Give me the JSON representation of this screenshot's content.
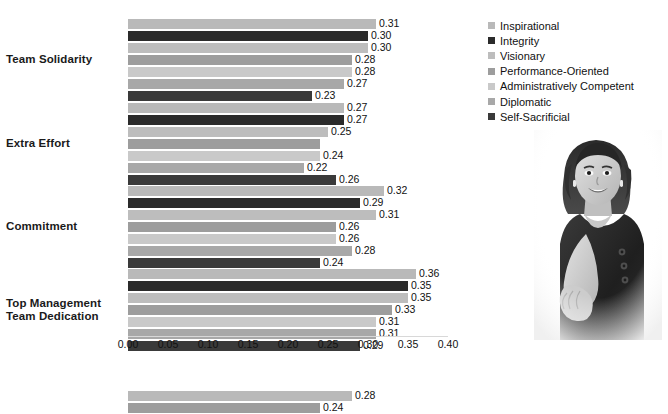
{
  "chart_data": {
    "type": "bar",
    "orientation": "horizontal",
    "title": "",
    "xlabel": "",
    "ylabel": "",
    "xlim": [
      0.0,
      0.4
    ],
    "xticks": [
      "0.00",
      "0.05",
      "0.10",
      "0.15",
      "0.20",
      "0.25",
      "0.30",
      "0.35",
      "0.40"
    ],
    "xtick_values": [
      0.0,
      0.05,
      0.1,
      0.15,
      0.2,
      0.25,
      0.3,
      0.35,
      0.4
    ],
    "grid": false,
    "legend_position": "top-right",
    "categories": [
      "Team Solidarity",
      "Extra Effort",
      "Commitment",
      "Top Management Team Dedication"
    ],
    "series": [
      {
        "name": "Inspirational",
        "color": "#b9b9b9",
        "values": [
          0.31,
          0.27,
          0.32,
          0.36
        ],
        "labels": [
          "0.31",
          "0.27",
          "0.32",
          "0.36"
        ]
      },
      {
        "name": "Integrity",
        "color": "#2b2b2b",
        "values": [
          0.3,
          0.27,
          0.29,
          0.35
        ],
        "labels": [
          "0.30",
          "0.27",
          "0.29",
          "0.35"
        ]
      },
      {
        "name": "Visionary",
        "color": "#bdbdbd",
        "values": [
          0.3,
          0.25,
          0.31,
          0.35
        ],
        "labels": [
          "0.30",
          "0.25",
          "0.31",
          "0.35"
        ]
      },
      {
        "name": "Performance-Oriented",
        "color": "#9d9d9d",
        "values": [
          0.28,
          0.24,
          0.26,
          0.33
        ],
        "labels": [
          "0.28",
          "",
          "0.26",
          "0.33"
        ]
      },
      {
        "name": "Administratively Competent",
        "color": "#c9c9c9",
        "values": [
          0.28,
          0.24,
          0.26,
          0.31
        ],
        "labels": [
          "0.28",
          "0.24",
          "0.26",
          "0.31"
        ]
      },
      {
        "name": "Diplomatic",
        "color": "#a8a8a8",
        "values": [
          0.27,
          0.22,
          0.28,
          0.31
        ],
        "labels": [
          "0.27",
          "0.22",
          "0.28",
          "0.31"
        ]
      },
      {
        "name": "Self-Sacrificial",
        "color": "#3a3a3a",
        "values": [
          0.23,
          0.26,
          0.24,
          0.29
        ],
        "labels": [
          "0.23",
          "0.26",
          "0.24",
          "0.29"
        ]
      }
    ]
  },
  "legend": {
    "items": [
      {
        "label": "Inspirational",
        "color": "#b9b9b9"
      },
      {
        "label": "Integrity",
        "color": "#2b2b2b"
      },
      {
        "label": "Visionary",
        "color": "#bdbdbd"
      },
      {
        "label": "Performance-Oriented",
        "color": "#9d9d9d"
      },
      {
        "label": "Administratively Competent",
        "color": "#c9c9c9"
      },
      {
        "label": "Diplomatic",
        "color": "#a8a8a8"
      },
      {
        "label": "Self-Sacrificial",
        "color": "#3a3a3a"
      }
    ]
  },
  "category_labels": [
    {
      "lines": [
        "Team Solidarity"
      ]
    },
    {
      "lines": [
        "Extra Effort"
      ]
    },
    {
      "lines": [
        "Commitment"
      ]
    },
    {
      "lines": [
        "Top Management",
        "Team Dedication"
      ]
    }
  ],
  "photo": {
    "alt": "businesswoman-handshake-photo"
  },
  "next_chart_partial": {
    "type": "bar",
    "orientation": "horizontal",
    "values": [
      0.28,
      0.24
    ],
    "labels": [
      "0.28",
      "0.24"
    ],
    "colors": [
      "#b9b9b9",
      "#9d9d9d"
    ]
  }
}
